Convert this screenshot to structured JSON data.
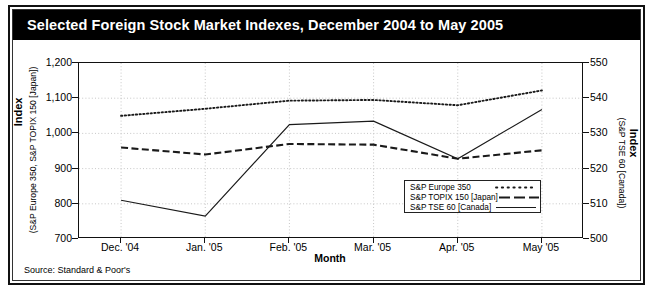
{
  "title": "Selected Foreign Stock Market Indexes, December 2004 to May 2005",
  "source_note": "Source: Standard & Poor's",
  "axis": {
    "x_label": "Month",
    "y_left_main": "Index",
    "y_left_sub": "(S&P Europe 350, S&P TOPIX 150 [Japan])",
    "y_right_main": "Index",
    "y_right_sub": "(S&P TSE 60 [Canada])"
  },
  "chart_data": {
    "type": "line",
    "title": "Selected Foreign Stock Market Indexes, December 2004 to May 2005",
    "xlabel": "Month",
    "ylabel": "Index (S&P Europe 350, S&P TOPIX 150 [Japan])",
    "y2label": "Index (S&P TSE 60 [Canada])",
    "categories": [
      "Dec. '04",
      "Jan. '05",
      "Feb. '05",
      "Mar. '05",
      "Apr. '05",
      "May '05"
    ],
    "ylim": [
      700,
      1200
    ],
    "yticks": [
      "700",
      "800",
      "900",
      "1,000",
      "1,100",
      "1,200"
    ],
    "ytick_values": [
      700,
      800,
      900,
      1000,
      1100,
      1200
    ],
    "y2lim": [
      500,
      550
    ],
    "y2ticks": [
      "500",
      "510",
      "520",
      "530",
      "540",
      "550"
    ],
    "y2tick_values": [
      500,
      510,
      520,
      530,
      540,
      550
    ],
    "grid": true,
    "legend_position": "inside-lower-right",
    "series": [
      {
        "name": "S&P Europe 350",
        "axis": "left",
        "style": "dotted",
        "values": [
          1050,
          1070,
          1093,
          1095,
          1080,
          1122
        ]
      },
      {
        "name": "S&P TOPIX 150 [Japan]",
        "axis": "left",
        "style": "dashed",
        "values": [
          960,
          940,
          970,
          968,
          928,
          952
        ]
      },
      {
        "name": "S&P TSE 60 [Canada]",
        "axis": "right",
        "style": "solid",
        "values": [
          511,
          506.5,
          532.5,
          533.5,
          522.8,
          536.8
        ]
      }
    ]
  }
}
